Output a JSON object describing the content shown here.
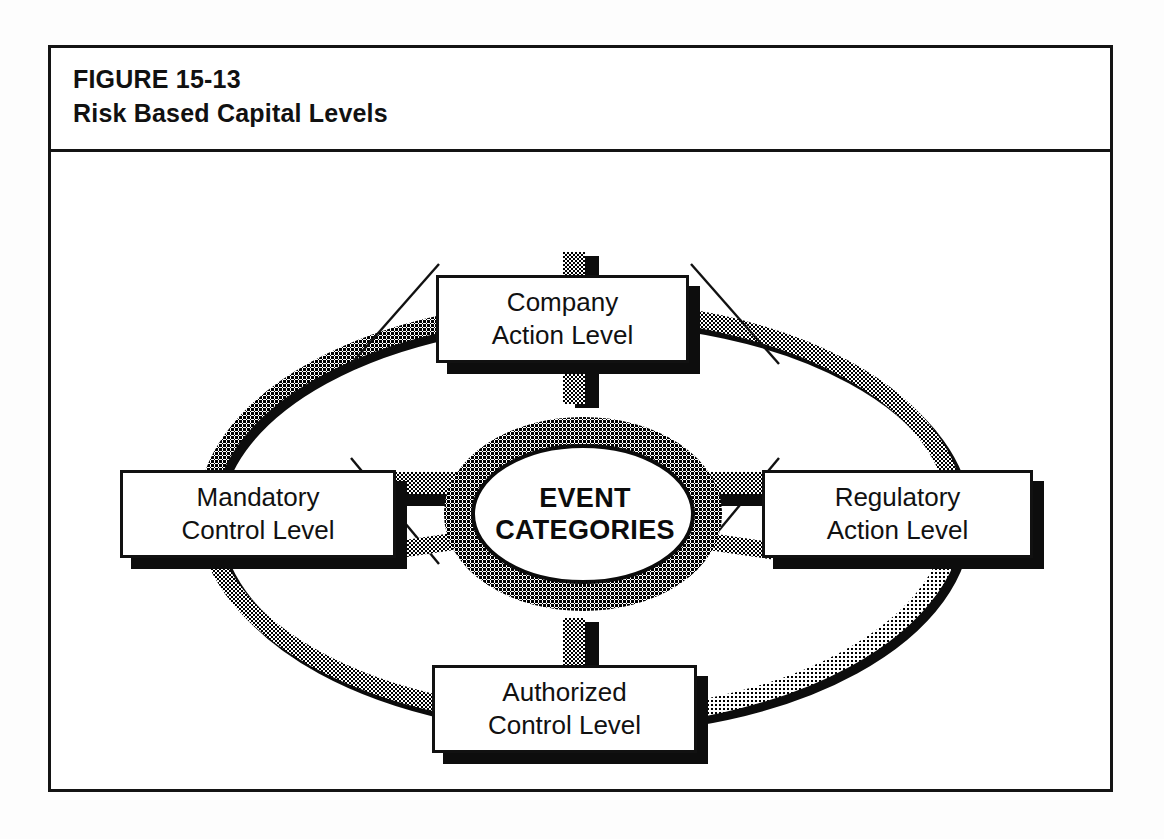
{
  "figure": {
    "number_label": "FIGURE 15-13",
    "title": "Risk Based Capital Levels"
  },
  "diagram": {
    "type": "radial-hub-and-spoke",
    "center": {
      "line1": "EVENT",
      "line2": "CATEGORIES"
    },
    "nodes": [
      {
        "id": "company",
        "position": "top",
        "line1": "Company",
        "line2": "Action Level"
      },
      {
        "id": "mandatory",
        "position": "left",
        "line1": "Mandatory",
        "line2": "Control Level"
      },
      {
        "id": "regulatory",
        "position": "right",
        "line1": "Regulatory",
        "line2": "Action Level"
      },
      {
        "id": "authorized",
        "position": "bottom",
        "line1": "Authorized",
        "line2": "Control Level"
      }
    ],
    "connections": [
      {
        "from": "center",
        "to": "company",
        "style": "halftone-spoke"
      },
      {
        "from": "center",
        "to": "mandatory",
        "style": "halftone-spoke"
      },
      {
        "from": "center",
        "to": "regulatory",
        "style": "halftone-spoke"
      },
      {
        "from": "center",
        "to": "authorized",
        "style": "halftone-spoke"
      },
      {
        "from": "company",
        "to": "mandatory",
        "style": "thin-diagonal"
      },
      {
        "from": "company",
        "to": "regulatory",
        "style": "thin-diagonal"
      },
      {
        "from": "mandatory",
        "to": "authorized",
        "style": "thin-diagonal"
      },
      {
        "from": "regulatory",
        "to": "authorized",
        "style": "thin-diagonal"
      }
    ],
    "outer_ring": {
      "shape": "ellipse",
      "style": "halftone-band",
      "shading": [
        "dark-top-left",
        "medium-top-right",
        "light-bottom-right",
        "medium-bottom-left"
      ]
    }
  },
  "colors": {
    "ink": "#111111",
    "paper": "#ffffff",
    "page": "#fdfdfd",
    "shadow": "#0d0d0d",
    "halftone_dark": "#1c1c1c",
    "halftone_mid": "#4d4d4d",
    "halftone_light": "#8e8e8e"
  }
}
